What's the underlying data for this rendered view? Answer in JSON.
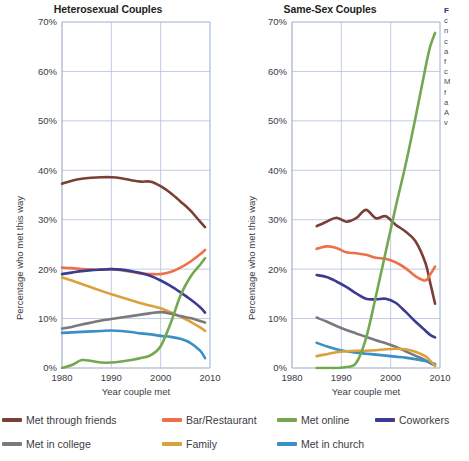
{
  "figure": {
    "legend": [
      {
        "key": "friends",
        "label": "Met through friends",
        "color": "#7b3f36"
      },
      {
        "key": "bar",
        "label": "Bar/Restaurant",
        "color": "#ef6f46"
      },
      {
        "key": "online",
        "label": "Met online",
        "color": "#74a850"
      },
      {
        "key": "coworkers",
        "label": "Coworkers",
        "color": "#3b3b8f"
      },
      {
        "key": "college",
        "label": "Met in college",
        "color": "#7a7a7d"
      },
      {
        "key": "family",
        "label": "Family",
        "color": "#d9a23c"
      },
      {
        "key": "church",
        "label": "Met in church",
        "color": "#3a8fc4"
      }
    ],
    "sidenote": {
      "title": "F",
      "lines": [
        "c",
        "n",
        "c",
        "a",
        "f",
        "c",
        "M",
        "f",
        "a",
        "A",
        "v"
      ]
    }
  },
  "chart_data": [
    {
      "id": "heterosexual",
      "type": "line",
      "title": "Heterosexual Couples",
      "xlabel": "Year couple met",
      "ylabel": "Percentage who met this way",
      "xlim": [
        1980,
        2010
      ],
      "ylim": [
        0,
        70
      ],
      "xticks": [
        1980,
        1990,
        2000,
        2010
      ],
      "yticks": [
        0,
        10,
        20,
        30,
        40,
        50,
        60,
        70
      ],
      "ytick_labels": [
        "0%",
        "10%",
        "20%",
        "30%",
        "40%",
        "50%",
        "60%",
        "70%"
      ],
      "xtick_labels": [
        "1980",
        "1990",
        "2000",
        "2010"
      ],
      "grid": true,
      "legend_position": "below-figure",
      "x": [
        1980,
        1982,
        1984,
        1986,
        1988,
        1990,
        1992,
        1994,
        1996,
        1998,
        2000,
        2002,
        2004,
        2006,
        2008,
        2009
      ],
      "series": [
        {
          "name": "Met through friends",
          "color": "#7b3f36",
          "values": [
            37.3,
            37.9,
            38.3,
            38.5,
            38.6,
            38.6,
            38.4,
            38.0,
            37.7,
            37.7,
            36.8,
            35.4,
            33.7,
            31.9,
            29.6,
            28.5
          ]
        },
        {
          "name": "Bar/Restaurant",
          "color": "#ef6f46",
          "values": [
            20.3,
            20.2,
            20.0,
            19.9,
            19.9,
            20.0,
            19.8,
            19.5,
            19.1,
            19.0,
            19.0,
            19.4,
            20.3,
            21.5,
            23.0,
            23.9
          ]
        },
        {
          "name": "Coworkers",
          "color": "#3b3b8f",
          "values": [
            19.0,
            19.3,
            19.6,
            19.8,
            19.9,
            20.0,
            19.9,
            19.6,
            19.2,
            18.6,
            17.7,
            16.6,
            15.3,
            13.9,
            12.3,
            11.2
          ]
        },
        {
          "name": "Family",
          "color": "#d9a23c",
          "values": [
            18.3,
            17.7,
            17.0,
            16.3,
            15.6,
            14.9,
            14.3,
            13.7,
            13.1,
            12.6,
            12.1,
            11.3,
            10.4,
            9.4,
            8.2,
            7.5
          ]
        },
        {
          "name": "Met in college",
          "color": "#7a7a7d",
          "values": [
            8.0,
            8.3,
            8.8,
            9.2,
            9.6,
            9.9,
            10.2,
            10.5,
            10.8,
            11.1,
            11.3,
            11.0,
            10.5,
            10.1,
            9.5,
            9.2
          ]
        },
        {
          "name": "Met in church",
          "color": "#3a8fc4",
          "values": [
            7.1,
            7.2,
            7.3,
            7.4,
            7.5,
            7.6,
            7.5,
            7.3,
            7.0,
            6.8,
            6.5,
            6.3,
            5.9,
            5.1,
            3.5,
            2.0
          ]
        },
        {
          "name": "Met online",
          "color": "#74a850",
          "values": [
            0.0,
            0.6,
            1.6,
            1.4,
            1.1,
            1.1,
            1.3,
            1.6,
            2.0,
            2.6,
            4.4,
            9.0,
            14.6,
            18.4,
            20.9,
            22.2
          ]
        }
      ]
    },
    {
      "id": "same-sex",
      "type": "line",
      "title": "Same-Sex Couples",
      "xlabel": "Year couple met",
      "ylabel": "Percentage who met this way",
      "xlim": [
        1980,
        2010
      ],
      "ylim": [
        0,
        70
      ],
      "xticks": [
        1980,
        1990,
        2000,
        2010
      ],
      "yticks": [
        0,
        10,
        20,
        30,
        40,
        50,
        60,
        70
      ],
      "ytick_labels": [
        "0%",
        "10%",
        "20%",
        "30%",
        "40%",
        "50%",
        "60%",
        "70%"
      ],
      "xtick_labels": [
        "1980",
        "1990",
        "2000",
        "2010"
      ],
      "grid": true,
      "legend_position": "below-figure",
      "x": [
        1985,
        1987,
        1989,
        1991,
        1993,
        1995,
        1997,
        1999,
        2001,
        2003,
        2005,
        2007,
        2008,
        2009
      ],
      "series": [
        {
          "name": "Met through friends",
          "color": "#7b3f36",
          "values": [
            28.7,
            29.6,
            30.4,
            29.6,
            30.3,
            32.0,
            30.3,
            30.7,
            29.0,
            27.6,
            25.7,
            21.4,
            17.3,
            13.0
          ]
        },
        {
          "name": "Bar/Restaurant",
          "color": "#ef6f46",
          "values": [
            24.1,
            24.6,
            24.3,
            23.4,
            23.2,
            22.9,
            22.3,
            22.1,
            21.4,
            20.2,
            18.6,
            17.7,
            18.9,
            20.5
          ]
        },
        {
          "name": "Coworkers",
          "color": "#3b3b8f",
          "values": [
            18.8,
            18.4,
            17.5,
            16.4,
            15.1,
            14.0,
            13.9,
            14.0,
            13.2,
            11.4,
            9.4,
            7.6,
            6.7,
            6.2
          ]
        },
        {
          "name": "Met in college",
          "color": "#7a7a7d",
          "values": [
            10.2,
            9.4,
            8.5,
            7.7,
            7.0,
            6.3,
            5.6,
            5.0,
            4.3,
            3.4,
            2.5,
            1.6,
            1.0,
            0.5
          ]
        },
        {
          "name": "Met in church",
          "color": "#3a8fc4",
          "values": [
            5.1,
            4.4,
            3.8,
            3.4,
            3.1,
            2.9,
            2.7,
            2.5,
            2.3,
            2.1,
            1.8,
            1.4,
            1.1,
            0.8
          ]
        },
        {
          "name": "Family",
          "color": "#d9a23c",
          "values": [
            2.4,
            2.8,
            3.2,
            3.4,
            3.5,
            3.5,
            3.6,
            3.8,
            3.9,
            3.8,
            3.3,
            2.4,
            1.5,
            0.4
          ]
        },
        {
          "name": "Met online",
          "color": "#74a850",
          "values": [
            0.0,
            0.0,
            0.0,
            0.2,
            1.0,
            6.0,
            14.5,
            23.5,
            32.5,
            41.0,
            50.5,
            60.5,
            65.0,
            67.8
          ]
        }
      ]
    }
  ]
}
